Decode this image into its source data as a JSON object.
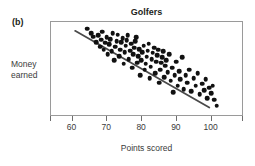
{
  "figure": {
    "panel_label": "(b)",
    "title": "Golfers",
    "ylabel": "Money\nearned",
    "ylabel_line1": "Money",
    "ylabel_line2": "earned",
    "xlabel": "Points scored"
  },
  "chart_data": {
    "type": "scatter",
    "title": "Golfers",
    "xlabel": "Points scored",
    "ylabel": "Money earned",
    "panel": "(b)",
    "xlim": [
      53.8,
      109.3
    ],
    "ylim": [
      0,
      100
    ],
    "xticks": [
      60,
      70,
      80,
      90,
      100
    ],
    "xticklabels": [
      "60",
      "70",
      "80",
      "90",
      "100"
    ],
    "yticks": [],
    "yticklabels": [],
    "grid": false,
    "legend": null,
    "point_color": "#111111",
    "line_color": "#4a4a4a",
    "frame_color": "#9a9a9a",
    "correlation": "strong negative",
    "n_points": 95,
    "trendline": {
      "type": "linear-fit",
      "x_start": 60.8,
      "y_start": 90.5,
      "x_end": 99.8,
      "y_end": 8.0
    },
    "x": [
      64.2,
      65.3,
      66.0,
      66.8,
      67.4,
      67.9,
      68.2,
      68.6,
      69.0,
      69.4,
      69.8,
      70.1,
      70.5,
      70.9,
      71.3,
      71.6,
      72.0,
      72.3,
      72.7,
      73.0,
      73.4,
      73.7,
      74.0,
      74.4,
      74.7,
      75.0,
      75.3,
      75.6,
      75.9,
      76.2,
      76.5,
      76.8,
      77.1,
      77.4,
      77.7,
      78.0,
      78.3,
      78.6,
      78.9,
      79.2,
      79.5,
      79.8,
      80.1,
      80.4,
      80.7,
      81.0,
      81.3,
      81.6,
      81.9,
      82.2,
      82.5,
      82.8,
      83.1,
      83.4,
      83.7,
      84.0,
      84.3,
      84.6,
      84.9,
      85.2,
      85.5,
      85.8,
      86.1,
      86.4,
      86.7,
      87.0,
      87.4,
      87.8,
      88.2,
      88.6,
      89.0,
      89.4,
      89.8,
      90.2,
      90.6,
      91.0,
      91.5,
      92.0,
      92.5,
      93.0,
      93.6,
      94.2,
      94.8,
      95.4,
      96.0,
      96.6,
      97.2,
      97.8,
      98.3,
      98.8,
      99.3,
      99.8,
      100.3,
      100.8,
      101.4
    ],
    "y": [
      93.0,
      88.0,
      84.5,
      79.0,
      86.0,
      74.0,
      81.5,
      90.0,
      71.0,
      78.0,
      84.0,
      66.0,
      76.5,
      82.0,
      69.0,
      88.5,
      60.0,
      74.0,
      80.0,
      86.5,
      64.0,
      71.0,
      78.5,
      83.0,
      56.0,
      68.0,
      75.0,
      81.0,
      86.0,
      61.0,
      70.0,
      77.0,
      52.0,
      66.0,
      73.0,
      79.5,
      84.0,
      57.0,
      64.0,
      71.5,
      44.0,
      60.0,
      68.0,
      75.0,
      50.0,
      56.0,
      63.5,
      70.0,
      77.0,
      41.0,
      53.0,
      61.0,
      67.5,
      73.0,
      46.0,
      58.0,
      65.0,
      71.0,
      36.0,
      50.0,
      57.0,
      63.0,
      69.5,
      42.0,
      54.0,
      60.0,
      47.0,
      66.0,
      38.0,
      52.0,
      26.0,
      44.0,
      58.0,
      33.0,
      48.0,
      40.0,
      63.0,
      29.0,
      44.0,
      36.0,
      50.0,
      27.0,
      41.0,
      33.0,
      46.0,
      24.0,
      35.0,
      28.0,
      40.0,
      20.0,
      31.0,
      25.0,
      33.0,
      18.0,
      12.0
    ]
  }
}
